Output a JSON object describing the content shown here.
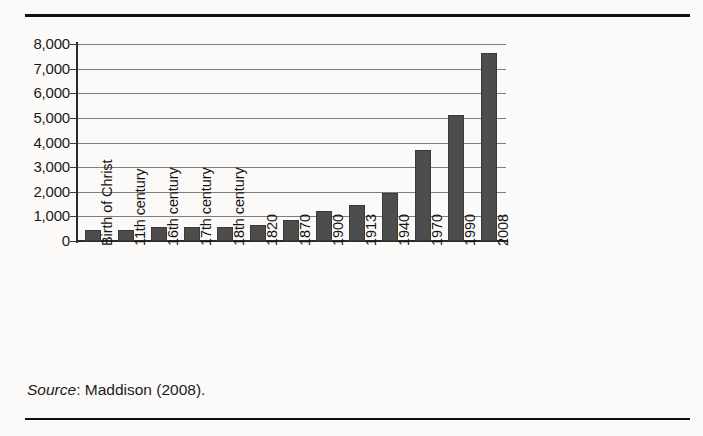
{
  "figure": {
    "source_label": "Source",
    "source_separator": ": ",
    "source_text": "Maddison (2008)."
  },
  "colors": {
    "bar_fill": "#4d4d4d",
    "bar_stroke": "#3a3a3a",
    "gridline": "#7d7d7d",
    "axis": "#2b2b2b",
    "rule": "#111111",
    "background": "#fbfaf8",
    "text": "#141414"
  },
  "chart_data": {
    "type": "bar",
    "title": "",
    "xlabel": "",
    "ylabel": "",
    "ylim": [
      0,
      8000
    ],
    "ytick_step": 1000,
    "grid": true,
    "legend": "none",
    "ytick_labels": [
      "0",
      "1,000",
      "2,000",
      "3,000",
      "4,000",
      "5,000",
      "6,000",
      "7,000",
      "8,000"
    ],
    "ytick_values": [
      0,
      1000,
      2000,
      3000,
      4000,
      5000,
      6000,
      7000,
      8000
    ],
    "categories": [
      "Birth of Christ",
      "11th century",
      "16th century",
      "17th century",
      "18th century",
      "1820",
      "1870",
      "1900",
      "1913",
      "1940",
      "1970",
      "1990",
      "2008"
    ],
    "values": [
      450,
      430,
      550,
      550,
      580,
      650,
      870,
      1200,
      1450,
      1950,
      3700,
      5100,
      7620
    ]
  }
}
